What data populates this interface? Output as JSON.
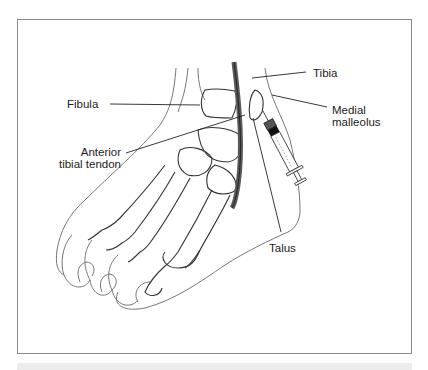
{
  "figure": {
    "colors": {
      "frame": "#8a8a8a",
      "outline": "#555555",
      "bone": "#333333",
      "tendon": "#5a5a5a",
      "band": "#ececec",
      "text": "#222222"
    }
  },
  "labels": {
    "tibia": "Tibia",
    "fibula": "Fibula",
    "medial_malleolus_line1": "Medial",
    "medial_malleolus_line2": "malleolus",
    "anterior_tibial_tendon_line1": "Anterior",
    "anterior_tibial_tendon_line2": "tibial tendon",
    "talus": "Talus"
  }
}
